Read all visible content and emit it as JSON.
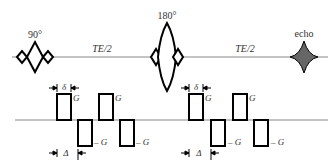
{
  "diagram": {
    "rf": {
      "pulse_90_label": "90°",
      "pulse_180_label": "180°",
      "echo_label": "echo",
      "interval_1_label": "TE/2",
      "interval_2_label": "TE/2"
    },
    "gradients": {
      "positive_label": "G",
      "negative_label": "– G",
      "delta_label": "δ",
      "Delta_label": "Δ"
    },
    "colors": {
      "line": "#000000",
      "axis": "#888888",
      "echo_fill": "#666666",
      "text": "#333333"
    }
  }
}
